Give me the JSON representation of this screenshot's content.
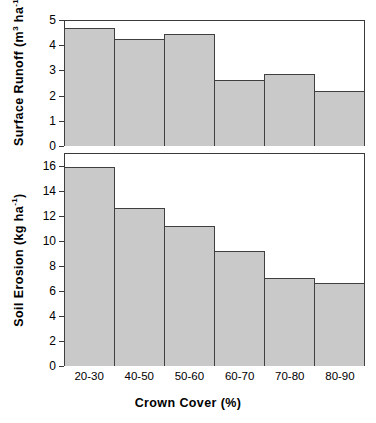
{
  "chart_data": {
    "type": "bar",
    "title": "",
    "subtitle": "",
    "xlabel": "Crown Cover (%)",
    "categories": [
      "20-30",
      "40-50",
      "50-60",
      "60-70",
      "70-80",
      "80-90"
    ],
    "grid": false,
    "legend": null,
    "panels": [
      {
        "id": "surface-runoff",
        "ylabel_parts": {
          "pre": "Surface Runoff (m",
          "sup1": "3",
          "mid": " ha",
          "sup2": "-1",
          "post": ")"
        },
        "ylabel": "Surface Runoff (m3 ha-1)",
        "ylim": [
          0,
          5
        ],
        "yticks": [
          0,
          1,
          2,
          3,
          4,
          5
        ],
        "ytick_labels": [
          "0",
          "1",
          "2",
          "3",
          "4",
          "5"
        ],
        "values": [
          4.7,
          4.25,
          4.45,
          2.6,
          2.85,
          2.2
        ]
      },
      {
        "id": "soil-erosion",
        "ylabel_parts": {
          "pre": "Soil Erosion (kg ha",
          "sup1": "-1",
          "mid": "",
          "sup2": "",
          "post": ")"
        },
        "ylabel": "Soil Erosion (kg ha-1)",
        "ylim": [
          0,
          17
        ],
        "yticks": [
          0,
          2,
          4,
          6,
          8,
          10,
          12,
          14,
          16
        ],
        "ytick_labels": [
          "0",
          "2",
          "4",
          "6",
          "8",
          "10",
          "12",
          "14",
          "16"
        ],
        "values": [
          15.9,
          12.6,
          11.15,
          9.2,
          7.0,
          6.65
        ]
      }
    ],
    "style": {
      "bar_fill": "#c9c9c9",
      "bar_border": "#3f3f3f",
      "axis_color": "#3a3a3a",
      "background": "#ffffff"
    }
  }
}
